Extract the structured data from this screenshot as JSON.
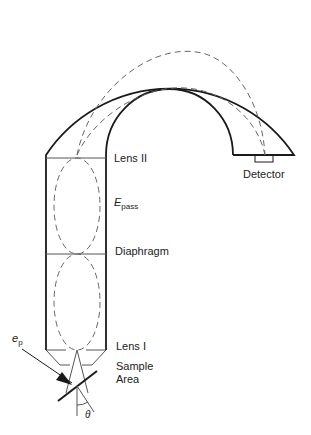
{
  "diagram": {
    "type": "hemispherical electron energy analyzer schematic",
    "labels": {
      "lens2": "Lens II",
      "detector": "Detector",
      "epass_main": "E",
      "epass_sub": "pass",
      "diaphragm": "Diaphragm",
      "lens1": "Lens I",
      "sample_line1": "Sample",
      "sample_line2": "Area",
      "ep_main": "e",
      "ep_sub": "p",
      "theta": "θ"
    },
    "colors": {
      "line": "#1a1a1a",
      "dashed": "#666666",
      "text": "#222222"
    }
  }
}
